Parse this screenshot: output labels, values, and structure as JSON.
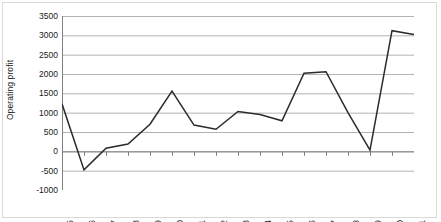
{
  "chart_data": {
    "type": "line",
    "title": "",
    "subtitle": "",
    "xlabel": "",
    "ylabel": "Operating profit",
    "categories": [
      "1995",
      "1996",
      "1997",
      "1998",
      "1999",
      "2000",
      "2001",
      "2002",
      "2003",
      "2004",
      "2005",
      "2006",
      "2007",
      "2008",
      "2009",
      "2010",
      "2011"
    ],
    "values": [
      1230,
      -480,
      80,
      190,
      700,
      1560,
      680,
      570,
      1030,
      950,
      790,
      2020,
      2060,
      1000,
      30,
      3120,
      3020
    ],
    "series": [
      {
        "name": "Operating profit",
        "values": [
          1230,
          -480,
          80,
          190,
          700,
          1560,
          680,
          570,
          1030,
          950,
          790,
          2020,
          2060,
          1000,
          30,
          3120,
          3020
        ]
      }
    ],
    "ylim": [
      -1000,
      3500
    ],
    "ytick_values": [
      3500,
      3000,
      2500,
      2000,
      1500,
      1000,
      500,
      0,
      -500,
      -1000
    ],
    "ytick_labels": [
      "3500",
      "3000",
      "2500",
      "2000",
      "1500",
      "1000",
      "500",
      "0",
      "-500",
      "-1000"
    ],
    "grid": true,
    "grid_axis": "y",
    "legend": false,
    "legend_position": "none",
    "annotations": [],
    "colors": {
      "line": "#2b2b2b",
      "gridline": "#b3b3b3",
      "axis": "#808080",
      "border": "#d9d9d9",
      "text": "#1a1a1a",
      "background": "#ffffff"
    }
  }
}
